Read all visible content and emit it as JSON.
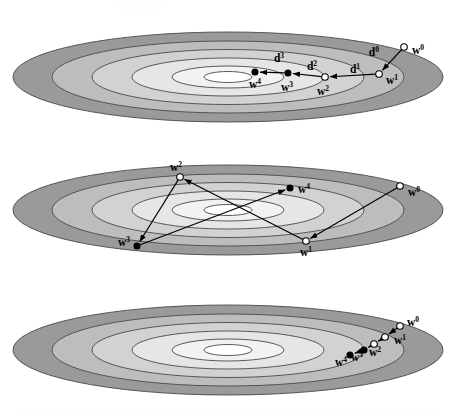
{
  "figure": {
    "width": 467,
    "height": 419,
    "background_color": "#ffffff",
    "panel_count": 3
  },
  "style": {
    "band_colors": [
      "#9a9a9a",
      "#bdbdbd",
      "#d2d2d2",
      "#e2e2e2",
      "#eeeeee",
      "#ffffff"
    ],
    "contour_stroke": "#4a4a4a",
    "path_stroke": "#000000",
    "marker_open_fill": "#ffffff",
    "marker_filled_fill": "#000000",
    "label_color": "#000000"
  },
  "panels": [
    {
      "id": "panel-1",
      "name": "steepest-descent-zigzag",
      "center": {
        "x": 228,
        "y": 77
      },
      "rings": [
        {
          "rx": 215,
          "ry": 45,
          "fill": "#9a9a9a"
        },
        {
          "rx": 176,
          "ry": 36,
          "fill": "#bdbdbd"
        },
        {
          "rx": 136,
          "ry": 27.5,
          "fill": "#d2d2d2"
        },
        {
          "rx": 96,
          "ry": 19,
          "fill": "#e6e6e6"
        },
        {
          "rx": 56,
          "ry": 11,
          "fill": "#f2f2f2"
        },
        {
          "rx": 24,
          "ry": 5.5,
          "fill": "#ffffff"
        }
      ],
      "points": [
        {
          "name": "w0",
          "label": "w",
          "superscript": "0",
          "x": 404,
          "y": 47,
          "marker": "open",
          "label_x": 412,
          "label_y": 54,
          "label_anchor": "start"
        },
        {
          "name": "w1",
          "label": "w",
          "superscript": "1",
          "x": 379,
          "y": 74,
          "marker": "open",
          "label_x": 386,
          "label_y": 84,
          "label_anchor": "start"
        },
        {
          "name": "w2",
          "label": "w",
          "superscript": "2",
          "x": 325,
          "y": 77,
          "marker": "open",
          "label_x": 323,
          "label_y": 95,
          "label_anchor": "middle"
        },
        {
          "name": "w3",
          "label": "w",
          "superscript": "3",
          "x": 288,
          "y": 73,
          "marker": "filled",
          "label_x": 287,
          "label_y": 91,
          "label_anchor": "middle"
        },
        {
          "name": "w4",
          "label": "w",
          "superscript": "4",
          "x": 255,
          "y": 72,
          "marker": "filled",
          "label_x": 255,
          "label_y": 88,
          "label_anchor": "middle"
        }
      ],
      "direction_labels": [
        {
          "name": "d0",
          "label": "d",
          "superscript": "0",
          "x": 379,
          "y": 56,
          "anchor": "end"
        },
        {
          "name": "d1",
          "label": "d",
          "superscript": "1",
          "x": 355,
          "y": 73,
          "anchor": "middle"
        },
        {
          "name": "d2",
          "label": "d",
          "superscript": "2",
          "x": 312,
          "y": 70,
          "anchor": "middle"
        },
        {
          "name": "d3",
          "label": "d",
          "superscript": "3",
          "x": 279,
          "y": 62,
          "anchor": "middle"
        }
      ],
      "segments": [
        {
          "name": "seg-w0-w1",
          "from": "w0",
          "to": "w1"
        },
        {
          "name": "seg-w1-w2",
          "from": "w1",
          "to": "w2"
        },
        {
          "name": "seg-w2-w3",
          "from": "w2",
          "to": "w3"
        },
        {
          "name": "seg-w3-w4",
          "from": "w3",
          "to": "w4"
        }
      ]
    },
    {
      "id": "panel-2",
      "name": "crossing-trajectory",
      "center": {
        "x": 228,
        "y": 210
      },
      "rings": [
        {
          "rx": 215,
          "ry": 45,
          "fill": "#9a9a9a"
        },
        {
          "rx": 176,
          "ry": 36,
          "fill": "#bdbdbd"
        },
        {
          "rx": 136,
          "ry": 27.5,
          "fill": "#d2d2d2"
        },
        {
          "rx": 96,
          "ry": 19,
          "fill": "#e6e6e6"
        },
        {
          "rx": 56,
          "ry": 11,
          "fill": "#f2f2f2"
        },
        {
          "rx": 24,
          "ry": 5.5,
          "fill": "#ffffff"
        }
      ],
      "points": [
        {
          "name": "w0",
          "label": "w",
          "superscript": "0",
          "x": 400,
          "y": 186,
          "marker": "open",
          "label_x": 408,
          "label_y": 196,
          "label_anchor": "start"
        },
        {
          "name": "w1",
          "label": "w",
          "superscript": "1",
          "x": 306,
          "y": 241,
          "marker": "open",
          "label_x": 306,
          "label_y": 256,
          "label_anchor": "middle"
        },
        {
          "name": "w2",
          "label": "w",
          "superscript": "2",
          "x": 180,
          "y": 177,
          "marker": "open",
          "label_x": 176,
          "label_y": 171,
          "label_anchor": "middle"
        },
        {
          "name": "w3",
          "label": "w",
          "superscript": "3",
          "x": 137,
          "y": 246,
          "marker": "filled",
          "label_x": 130,
          "label_y": 246,
          "label_anchor": "end"
        },
        {
          "name": "w4",
          "label": "w",
          "superscript": "4",
          "x": 290,
          "y": 188,
          "marker": "filled",
          "label_x": 298,
          "label_y": 193,
          "label_anchor": "start"
        }
      ],
      "direction_labels": [],
      "segments": [
        {
          "name": "seg-w0-w1",
          "from": "w0",
          "to": "w1"
        },
        {
          "name": "seg-w1-w2",
          "from": "w1",
          "to": "w2"
        },
        {
          "name": "seg-w2-w3",
          "from": "w2",
          "to": "w3"
        },
        {
          "name": "seg-w3-w4",
          "from": "w3",
          "to": "w4"
        }
      ]
    },
    {
      "id": "panel-3",
      "name": "converging-line-trajectory",
      "center": {
        "x": 228,
        "y": 350
      },
      "rings": [
        {
          "rx": 215,
          "ry": 45,
          "fill": "#9a9a9a"
        },
        {
          "rx": 176,
          "ry": 36,
          "fill": "#bdbdbd"
        },
        {
          "rx": 136,
          "ry": 27.5,
          "fill": "#d2d2d2"
        },
        {
          "rx": 96,
          "ry": 19,
          "fill": "#e6e6e6"
        },
        {
          "rx": 56,
          "ry": 11,
          "fill": "#f2f2f2"
        },
        {
          "rx": 24,
          "ry": 5.5,
          "fill": "#ffffff"
        }
      ],
      "points": [
        {
          "name": "w0",
          "label": "w",
          "superscript": "0",
          "x": 400,
          "y": 326,
          "marker": "open",
          "label_x": 407,
          "label_y": 326,
          "label_anchor": "start"
        },
        {
          "name": "w1",
          "label": "w",
          "superscript": "1",
          "x": 385,
          "y": 337,
          "marker": "open",
          "label_x": 394,
          "label_y": 344,
          "label_anchor": "start"
        },
        {
          "name": "w2",
          "label": "w",
          "superscript": "2",
          "x": 374,
          "y": 344,
          "marker": "open",
          "label_x": 375,
          "label_y": 356,
          "label_anchor": "middle"
        },
        {
          "name": "w3",
          "label": "w",
          "superscript": "3",
          "x": 364,
          "y": 350,
          "marker": "filled",
          "label_x": 357,
          "label_y": 361,
          "label_anchor": "middle"
        },
        {
          "name": "w4",
          "label": "w",
          "superscript": "4",
          "x": 350,
          "y": 355,
          "marker": "filled",
          "label_x": 341,
          "label_y": 366,
          "label_anchor": "middle"
        }
      ],
      "direction_labels": [],
      "segments": [
        {
          "name": "seg-w0-w1",
          "from": "w0",
          "to": "w1"
        },
        {
          "name": "seg-w1-w2",
          "from": "w1",
          "to": "w2"
        },
        {
          "name": "seg-w2-w3",
          "from": "w2",
          "to": "w3"
        },
        {
          "name": "seg-w3-w4",
          "from": "w3",
          "to": "w4"
        }
      ]
    }
  ]
}
